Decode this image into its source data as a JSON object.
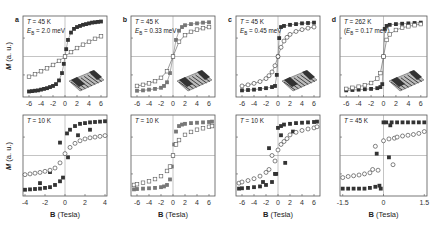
{
  "figure": {
    "ylabel": "M (a. u.)",
    "xlabel": "B (Tesla)"
  },
  "chart_data": [
    {
      "panel": "a",
      "row": "top",
      "type": "scatter",
      "annotation": [
        "T = 45 K",
        "E_B = 2.0 meV"
      ],
      "xlim": [
        -7,
        7
      ],
      "xticks": [
        -6,
        -4,
        -2,
        0,
        2,
        4,
        6
      ],
      "ylim": [
        -1.1,
        1.1
      ],
      "has_inset": true,
      "inset": "nanostructure-3d",
      "series": [
        {
          "name": "filled squares",
          "marker": "square-filled",
          "x": [
            -6,
            -5.5,
            -5,
            -4.5,
            -4,
            -3.5,
            -3,
            -2.5,
            -2,
            -1.5,
            -1,
            -0.5,
            -0.2,
            0,
            0.2,
            0.5,
            1,
            1.5,
            2,
            2.5,
            3,
            3.5,
            4,
            4.5,
            5,
            5.5,
            6
          ],
          "y": [
            -0.95,
            -0.94,
            -0.93,
            -0.92,
            -0.9,
            -0.88,
            -0.86,
            -0.83,
            -0.8,
            -0.75,
            -0.65,
            -0.45,
            -0.2,
            0,
            0.2,
            0.45,
            0.65,
            0.75,
            0.8,
            0.83,
            0.86,
            0.88,
            0.9,
            0.92,
            0.93,
            0.94,
            0.95
          ]
        },
        {
          "name": "open squares",
          "marker": "square-open",
          "x": [
            -6,
            -5,
            -4,
            -3,
            -2,
            -1,
            0,
            1,
            2,
            3,
            4,
            5,
            6
          ],
          "y": [
            -0.55,
            -0.48,
            -0.4,
            -0.32,
            -0.23,
            -0.12,
            0,
            0.12,
            0.23,
            0.32,
            0.4,
            0.48,
            0.55
          ]
        }
      ]
    },
    {
      "panel": "b",
      "row": "top",
      "type": "scatter",
      "annotation": [
        "T = 45 K",
        "E_B = 0.33 meV"
      ],
      "xlim": [
        -7,
        7
      ],
      "xticks": [
        -6,
        -4,
        -2,
        0,
        2,
        4,
        6
      ],
      "ylim": [
        -1.1,
        1.1
      ],
      "has_inset": true,
      "inset": "nanostructure-3d",
      "series": [
        {
          "name": "filled squares",
          "marker": "square-filled",
          "x": [
            -6,
            -5,
            -4,
            -3,
            -2,
            -1.5,
            -1,
            -0.5,
            0,
            0.5,
            1,
            1.5,
            2,
            3,
            4,
            5,
            6
          ],
          "y": [
            -0.93,
            -0.92,
            -0.9,
            -0.88,
            -0.85,
            -0.8,
            -0.7,
            -0.45,
            0,
            0.45,
            0.7,
            0.8,
            0.85,
            0.88,
            0.9,
            0.92,
            0.93
          ]
        },
        {
          "name": "open squares",
          "marker": "square-open",
          "x": [
            -6,
            -5,
            -4,
            -3,
            -2,
            -1,
            0,
            1,
            2,
            3,
            4,
            5,
            6
          ],
          "y": [
            -0.8,
            -0.77,
            -0.73,
            -0.67,
            -0.58,
            -0.4,
            0,
            0.4,
            0.58,
            0.67,
            0.73,
            0.77,
            0.8
          ]
        }
      ]
    },
    {
      "panel": "c",
      "row": "top",
      "type": "scatter",
      "annotation": [
        "T = 45 K",
        "E_B = 0.45 meV"
      ],
      "xlim": [
        -7,
        7
      ],
      "xticks": [
        -6,
        -4,
        -2,
        0,
        2,
        4,
        6
      ],
      "ylim": [
        -1.1,
        1.1
      ],
      "has_inset": true,
      "inset": "nanostructure-3d",
      "series": [
        {
          "name": "filled squares",
          "marker": "square-filled",
          "x": [
            -6,
            -5,
            -4,
            -3,
            -2,
            -1,
            -0.5,
            -0.2,
            0,
            0.2,
            0.5,
            1,
            2,
            3,
            4,
            5,
            6
          ],
          "y": [
            -0.92,
            -0.91,
            -0.9,
            -0.88,
            -0.86,
            -0.83,
            -0.8,
            -0.5,
            0,
            0.5,
            0.8,
            0.83,
            0.86,
            0.88,
            0.9,
            0.91,
            0.92
          ]
        },
        {
          "name": "open circles",
          "marker": "circle-open",
          "x": [
            -6,
            -5,
            -4,
            -3,
            -2,
            -1.5,
            -1,
            -0.5,
            0,
            0.5,
            1,
            1.5,
            2,
            3,
            4,
            5,
            6
          ],
          "y": [
            -0.8,
            -0.77,
            -0.73,
            -0.68,
            -0.6,
            -0.52,
            -0.42,
            -0.25,
            0,
            0.25,
            0.42,
            0.52,
            0.6,
            0.68,
            0.73,
            0.77,
            0.8
          ]
        }
      ]
    },
    {
      "panel": "d",
      "row": "top",
      "type": "scatter",
      "annotation": [
        "T = 262 K",
        "(E_B = 0.17 meV)"
      ],
      "xlim": [
        -7,
        7
      ],
      "xticks": [
        -6,
        -4,
        -2,
        0,
        2,
        4,
        6
      ],
      "ylim": [
        -1.1,
        1.1
      ],
      "has_inset": true,
      "inset": "nanostructure-3d",
      "series": [
        {
          "name": "filled squares",
          "marker": "square-filled",
          "x": [
            -6,
            -5,
            -4,
            -3,
            -2,
            -1,
            -0.5,
            -0.2,
            0,
            0.2,
            0.5,
            1,
            2,
            3,
            4,
            5,
            6
          ],
          "y": [
            -0.92,
            -0.91,
            -0.9,
            -0.89,
            -0.88,
            -0.86,
            -0.83,
            -0.75,
            0,
            0.75,
            0.83,
            0.86,
            0.88,
            0.89,
            0.9,
            0.91,
            0.92
          ]
        },
        {
          "name": "open squares",
          "marker": "square-open",
          "x": [
            -6,
            -5,
            -4,
            -3,
            -2,
            -1,
            -0.5,
            0,
            0.5,
            1,
            2,
            3,
            4,
            5,
            6
          ],
          "y": [
            -0.88,
            -0.85,
            -0.82,
            -0.78,
            -0.72,
            -0.6,
            -0.45,
            0,
            0.45,
            0.6,
            0.72,
            0.78,
            0.82,
            0.85,
            0.88
          ]
        }
      ]
    },
    {
      "panel": "a",
      "row": "bottom",
      "type": "scatter",
      "annotation": [
        "T = 10 K"
      ],
      "xlim": [
        -4.2,
        4.2
      ],
      "xticks": [
        -4,
        -2,
        0,
        2,
        4
      ],
      "ylim": [
        -1.1,
        1.1
      ],
      "series": [
        {
          "name": "filled squares",
          "marker": "square-filled",
          "x": [
            -4,
            -3.5,
            -3,
            -2.5,
            -2,
            -1.5,
            -1,
            -0.5,
            -0.2,
            0.2,
            0.5,
            1,
            1.5,
            2,
            2.5,
            3,
            3.5,
            4,
            -1.5,
            -2.5,
            -0.5,
            0.3,
            1.3,
            2.5
          ],
          "y": [
            -0.93,
            -0.92,
            -0.91,
            -0.9,
            -0.88,
            -0.86,
            -0.8,
            -0.7,
            -0.6,
            0.6,
            0.7,
            0.8,
            0.86,
            0.88,
            0.9,
            0.91,
            0.92,
            0.93,
            -0.45,
            -0.75,
            0.35,
            -0.05,
            0.55,
            0.7
          ]
        },
        {
          "name": "open circles",
          "marker": "circle-open",
          "x": [
            -4,
            -3.5,
            -3,
            -2.5,
            -2,
            -1.5,
            -1,
            -0.5,
            0,
            0.5,
            1,
            1.5,
            2,
            2.5,
            3,
            3.5,
            4
          ],
          "y": [
            -0.52,
            -0.5,
            -0.48,
            -0.46,
            -0.43,
            -0.4,
            -0.34,
            -0.2,
            0.05,
            0.22,
            0.33,
            0.4,
            0.45,
            0.48,
            0.5,
            0.52,
            0.54
          ]
        }
      ]
    },
    {
      "panel": "b",
      "row": "bottom",
      "type": "scatter",
      "annotation": [
        "T = 10 K"
      ],
      "xlim": [
        -7,
        7
      ],
      "xticks": [
        -6,
        -4,
        -2,
        0,
        2,
        4,
        6
      ],
      "ylim": [
        -1.1,
        1.1
      ],
      "series": [
        {
          "name": "filled squares",
          "marker": "square-filled",
          "x": [
            -6.5,
            -6,
            -5,
            -4,
            -3,
            -2,
            -1.5,
            -1,
            -0.5,
            -0.2,
            0,
            0.2,
            0.5,
            1,
            1.5,
            2,
            3,
            4,
            5,
            6,
            6.5
          ],
          "y": [
            -0.92,
            -0.91,
            -0.9,
            -0.89,
            -0.88,
            -0.86,
            -0.84,
            -0.8,
            -0.65,
            -0.3,
            0,
            0.3,
            0.65,
            0.8,
            0.84,
            0.86,
            0.88,
            0.89,
            0.9,
            0.91,
            0.92
          ]
        },
        {
          "name": "open squares",
          "marker": "square-open",
          "x": [
            -6.5,
            -6,
            -5,
            -4,
            -3,
            -2,
            -1,
            -0.5,
            0,
            0.5,
            1,
            2,
            3,
            4,
            5,
            6,
            6.5
          ],
          "y": [
            -0.8,
            -0.78,
            -0.74,
            -0.7,
            -0.64,
            -0.56,
            -0.42,
            -0.3,
            0,
            0.3,
            0.42,
            0.56,
            0.64,
            0.7,
            0.74,
            0.78,
            0.8
          ]
        }
      ]
    },
    {
      "panel": "c",
      "row": "bottom",
      "type": "scatter",
      "annotation": [
        "T = 10 K"
      ],
      "xlim": [
        -7,
        7
      ],
      "xticks": [
        -6,
        -4,
        -2,
        0,
        2,
        4,
        6
      ],
      "ylim": [
        -1.1,
        1.1
      ],
      "series": [
        {
          "name": "filled squares",
          "marker": "square-filled",
          "x": [
            -6.5,
            -6,
            -5,
            -4,
            -3,
            -2,
            -1,
            -0.5,
            0,
            0.5,
            1,
            2,
            3,
            4,
            5,
            6,
            6.5,
            -1.5,
            -2.5,
            -0.3,
            0.5,
            1.2,
            2.5
          ],
          "y": [
            -0.9,
            -0.89,
            -0.88,
            -0.86,
            -0.84,
            -0.8,
            -0.72,
            -0.5,
            0.75,
            0.8,
            0.84,
            0.86,
            0.88,
            0.89,
            0.9,
            0.91,
            0.92,
            0.2,
            -0.72,
            -0.5,
            0.55,
            -0.2,
            0.65
          ]
        },
        {
          "name": "open circles",
          "marker": "circle-open",
          "x": [
            -6.5,
            -6,
            -5,
            -4,
            -3,
            -2,
            -1.5,
            -1,
            -0.5,
            0,
            0.5,
            1,
            1.5,
            2,
            3,
            4,
            5,
            6,
            6.5
          ],
          "y": [
            -0.75,
            -0.72,
            -0.68,
            -0.63,
            -0.56,
            -0.46,
            -0.38,
            0.0,
            -0.15,
            0.15,
            0.3,
            0.38,
            0.46,
            0.56,
            0.63,
            0.68,
            0.72,
            0.75,
            0.78
          ]
        }
      ]
    },
    {
      "panel": "d",
      "row": "bottom",
      "type": "scatter",
      "annotation": [
        "T = 45 K"
      ],
      "xlim": [
        -1.6,
        1.6
      ],
      "xticks": [
        -1.5,
        0,
        1.5
      ],
      "ylim": [
        -1.1,
        1.1
      ],
      "series": [
        {
          "name": "filled squares",
          "marker": "square-filled",
          "x": [
            -1.5,
            -1.3,
            -1.1,
            -0.9,
            -0.7,
            -0.5,
            -0.3,
            -0.1,
            0,
            0.1,
            0.3,
            0.5,
            0.7,
            0.9,
            1.1,
            1.3,
            1.5,
            -0.25,
            0.2,
            0.25,
            -0.15
          ],
          "y": [
            -0.9,
            -0.9,
            -0.9,
            -0.9,
            -0.9,
            -0.88,
            -0.85,
            -0.9,
            0.9,
            0.9,
            0.9,
            0.9,
            0.9,
            0.9,
            0.9,
            0.9,
            0.9,
            0.05,
            -0.05,
            0.82,
            -0.82
          ]
        },
        {
          "name": "open circles",
          "marker": "circle-open",
          "x": [
            -1.5,
            -1.3,
            -1.1,
            -0.9,
            -0.7,
            -0.5,
            -0.4,
            -0.2,
            0,
            0.2,
            0.4,
            0.5,
            0.7,
            0.9,
            1.1,
            1.3,
            1.5,
            -0.3,
            0.35
          ],
          "y": [
            -0.6,
            -0.57,
            -0.55,
            -0.53,
            -0.5,
            -0.47,
            -0.38,
            -0.4,
            0.4,
            0.45,
            0.47,
            0.5,
            0.53,
            0.55,
            0.57,
            0.6,
            0.65,
            0.25,
            -0.25
          ]
        }
      ]
    }
  ]
}
